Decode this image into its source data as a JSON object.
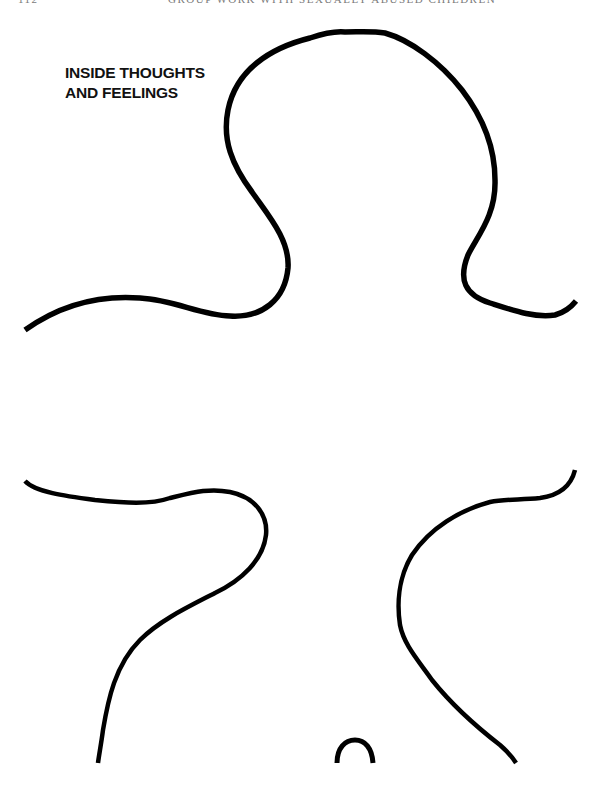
{
  "header": {
    "page_number": "112",
    "book_title": "GROUP WORK WITH SEXUALLY ABUSED CHILDREN"
  },
  "worksheet": {
    "title_line_1": "INSIDE THOUGHTS",
    "title_line_2": "AND FEELINGS",
    "figure": "gingerbread-body-outline",
    "stroke_color": "#000000",
    "background_color": "#ffffff"
  }
}
